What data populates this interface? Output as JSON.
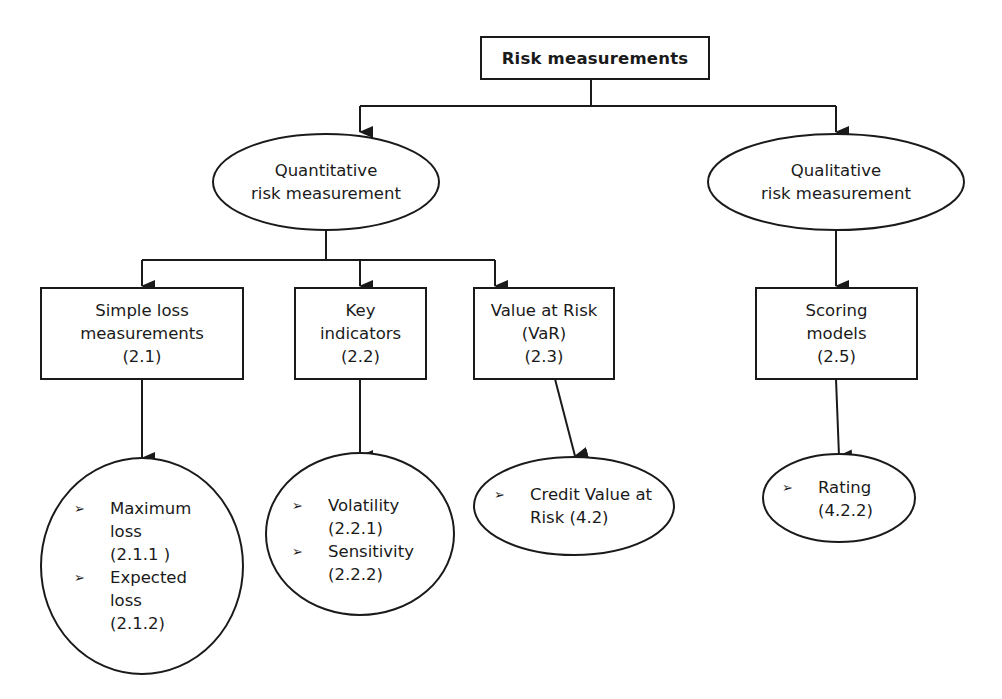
{
  "title": "Risk measurements",
  "branches": {
    "quantitative": {
      "lines": [
        "Quantitative",
        "risk measurement"
      ]
    },
    "qualitative": {
      "lines": [
        "Qualitative",
        "risk measurement"
      ]
    }
  },
  "methods": [
    {
      "id": "simple_loss",
      "lines": [
        "Simple loss",
        "measurements",
        "(2.1)"
      ]
    },
    {
      "id": "key_indicators",
      "lines": [
        "Key",
        "indicators",
        "(2.2)"
      ]
    },
    {
      "id": "var",
      "lines": [
        "Value at Risk",
        "(VaR)",
        "(2.3)"
      ]
    },
    {
      "id": "scoring",
      "lines": [
        "Scoring",
        "models",
        "(2.5)"
      ]
    }
  ],
  "leaves": [
    {
      "id": "simple_loss_leaf",
      "items": [
        {
          "bullet": "➢",
          "lines": [
            "Maximum",
            "loss",
            "(2.1.1 )"
          ]
        },
        {
          "bullet": "➢",
          "lines": [
            "Expected",
            "loss",
            "(2.1.2)"
          ]
        }
      ]
    },
    {
      "id": "key_indicators_leaf",
      "items": [
        {
          "bullet": "➢",
          "lines": [
            "Volatility",
            "(2.2.1)"
          ]
        },
        {
          "bullet": "➢",
          "lines": [
            "Sensitivity",
            "(2.2.2)"
          ]
        }
      ]
    },
    {
      "id": "var_leaf",
      "items": [
        {
          "bullet": "➢",
          "lines": [
            "Credit Value at",
            "Risk (4.2)"
          ]
        }
      ]
    },
    {
      "id": "scoring_leaf",
      "items": [
        {
          "bullet": "➢",
          "lines": [
            "Rating",
            "(4.2.2)"
          ]
        }
      ]
    }
  ],
  "colors": {
    "stroke": "#1a1a1a",
    "background": "#ffffff"
  }
}
